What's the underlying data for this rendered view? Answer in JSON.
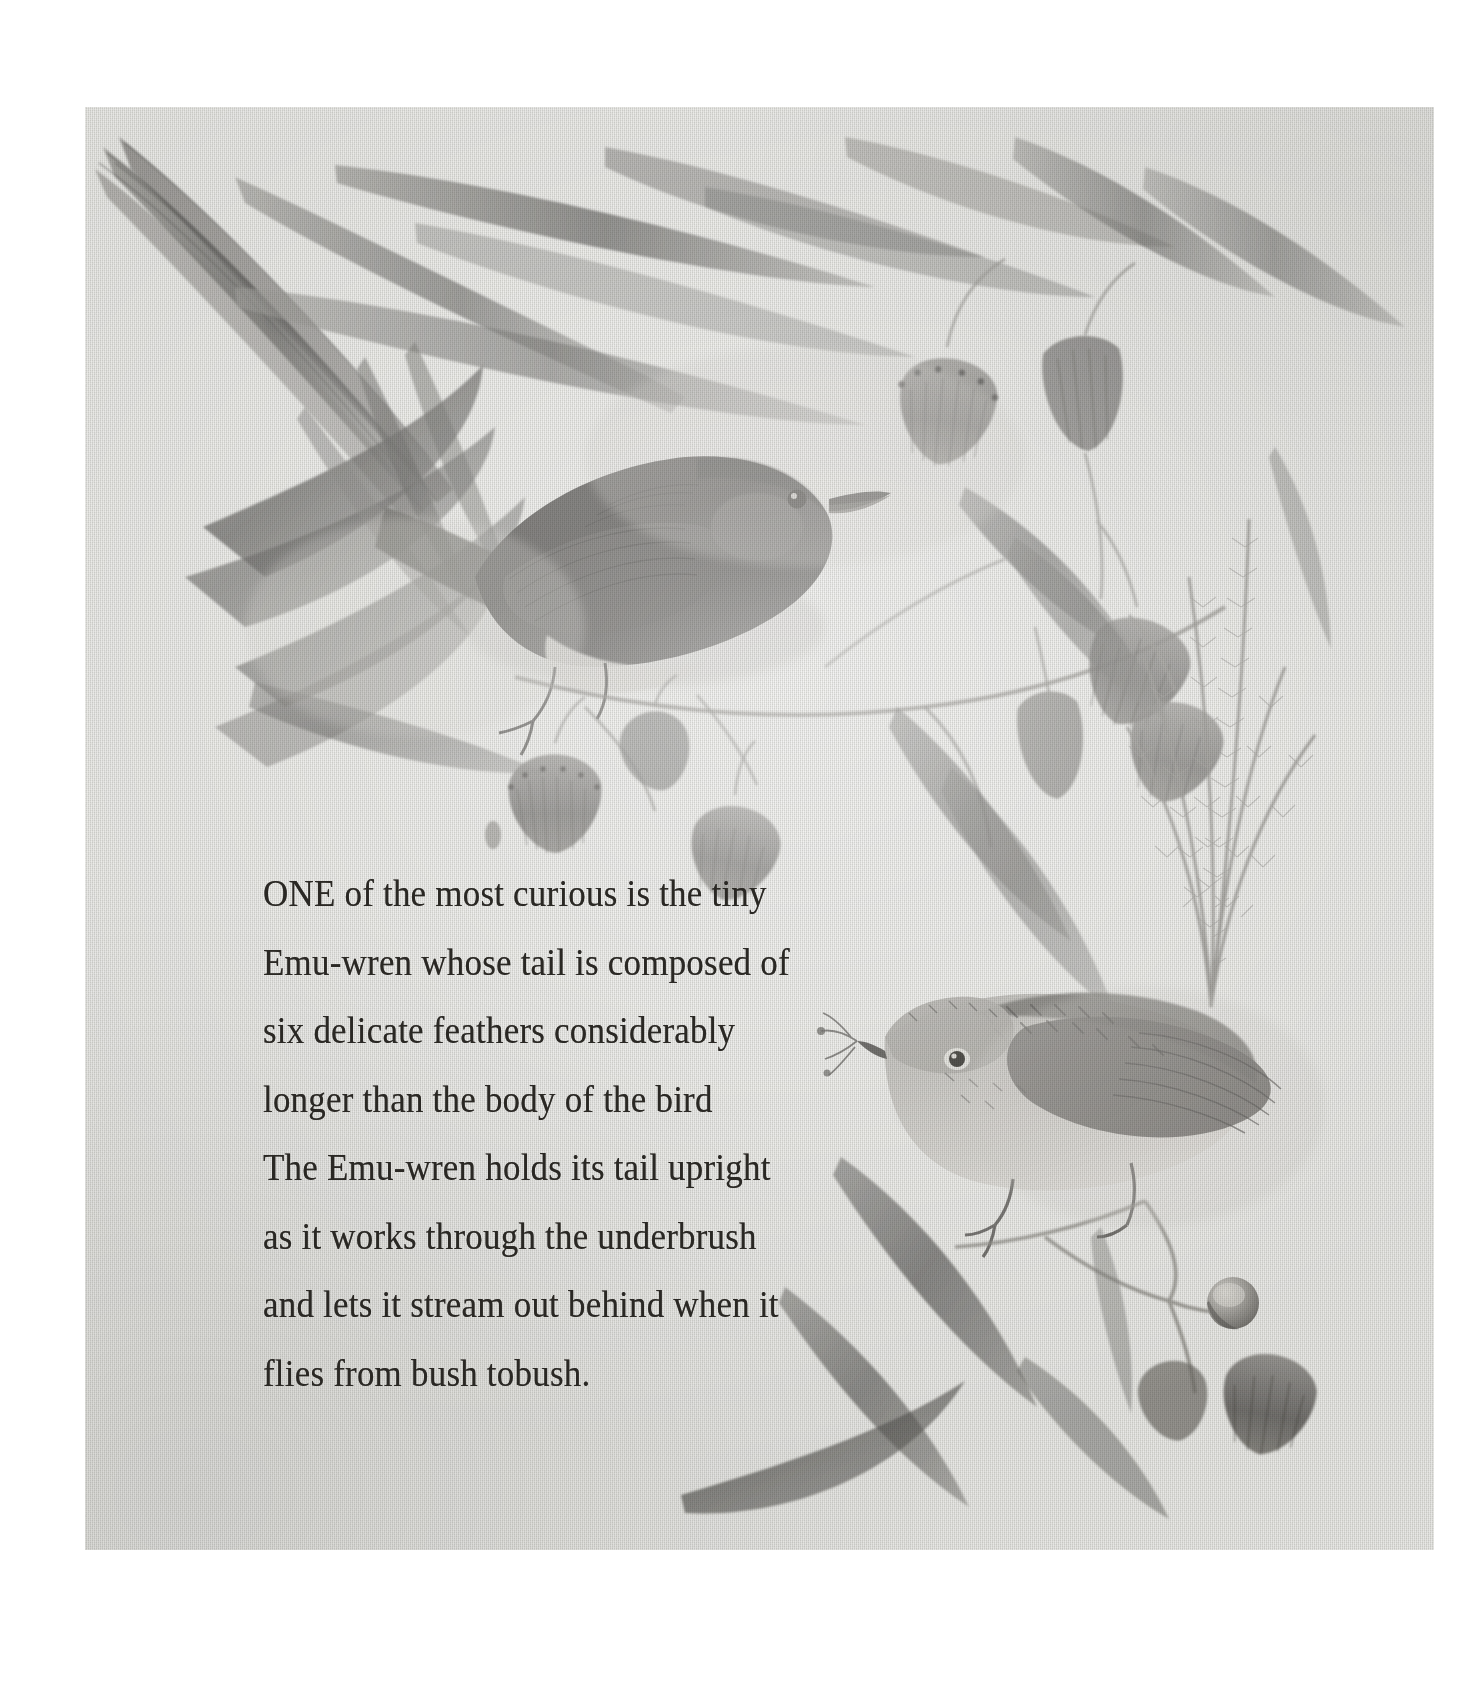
{
  "artwork": {
    "medium_note": "graphite pencil drawing on textured paper",
    "panel": {
      "left": 85,
      "top": 107,
      "width": 1349,
      "height": 1443
    },
    "background_color": "#e9e9e6",
    "ink_color": "#2a2824",
    "subjects": {
      "upper_bird": "dark emu-wren perched on eucalyptus branch",
      "lower_bird": "pale streaked emu-wren with upright filamentous tail",
      "foliage": "eucalyptus leaves, blossoms and gum nuts"
    }
  },
  "text": {
    "lines": [
      "ONE of the most curious is the tiny",
      "Emu-wren whose tail is composed of",
      "six delicate feathers considerably",
      "longer than the body of the bird",
      "The Emu-wren holds its tail upright",
      "as it works through the underbrush",
      "and lets it stream out behind when it",
      "flies from bush tobush."
    ]
  }
}
